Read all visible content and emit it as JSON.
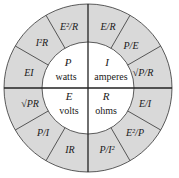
{
  "diagram": {
    "colors": {
      "ring_fill": "#d9d9d9",
      "center_fill": "#ffffff",
      "stroke": "#333333"
    },
    "quadrants": [
      {
        "id": "P",
        "symbol": "P",
        "unit": "watts",
        "formulas": [
          "EI",
          "I²R",
          "E²/R"
        ]
      },
      {
        "id": "I",
        "symbol": "I",
        "unit": "amperes",
        "formulas": [
          "E/R",
          "P/E",
          "√P/R"
        ]
      },
      {
        "id": "R",
        "symbol": "R",
        "unit": "ohms",
        "formulas": [
          "E/I",
          "E²/P",
          "P/I²"
        ]
      },
      {
        "id": "E",
        "symbol": "E",
        "unit": "volts",
        "formulas": [
          "IR",
          "P/I",
          "√PR"
        ]
      }
    ]
  }
}
